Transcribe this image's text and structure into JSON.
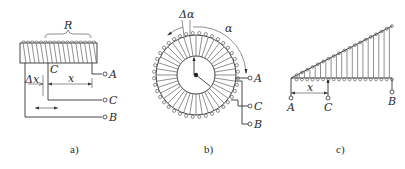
{
  "figure": {
    "panels": [
      {
        "id": "a",
        "caption": "a)",
        "description": "Linear wire-wound potentiometer with sliding contact",
        "labels": {
          "resistance": "R",
          "wiper": "C",
          "delta": "Δx",
          "displacement": "x",
          "terminal_a": "A",
          "terminal_c": "C",
          "terminal_b": "B"
        }
      },
      {
        "id": "b",
        "caption": "b)",
        "description": "Rotary (toroidal) wire-wound potentiometer",
        "labels": {
          "delta": "Δα",
          "angle": "α",
          "terminal_a": "A",
          "terminal_c": "C",
          "terminal_b": "B"
        }
      },
      {
        "id": "c",
        "caption": "c)",
        "description": "Nonlinear (function) potentiometer with tapered winding",
        "labels": {
          "displacement": "x",
          "terminal_a": "A",
          "terminal_c": "C",
          "terminal_b": "B"
        }
      }
    ],
    "colors": {
      "line": "#333333",
      "background": "#ffffff"
    }
  }
}
